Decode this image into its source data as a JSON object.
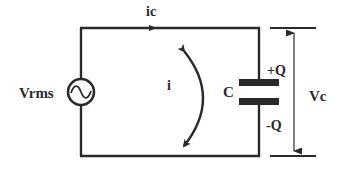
{
  "diagram": {
    "type": "ac-capacitor-circuit",
    "colors": {
      "wire": "#2a2a2a",
      "background": "#ffffff"
    },
    "labels": {
      "source": "Vrms",
      "current_top": "ic",
      "loop_current": "i",
      "capacitor": "C",
      "plus_charge": "+Q",
      "minus_charge": "-Q",
      "capacitor_voltage": "Vc"
    },
    "components": [
      {
        "name": "ac-voltage-source",
        "label": "Vrms",
        "symbol": "~"
      },
      {
        "name": "capacitor",
        "label": "C"
      }
    ]
  }
}
